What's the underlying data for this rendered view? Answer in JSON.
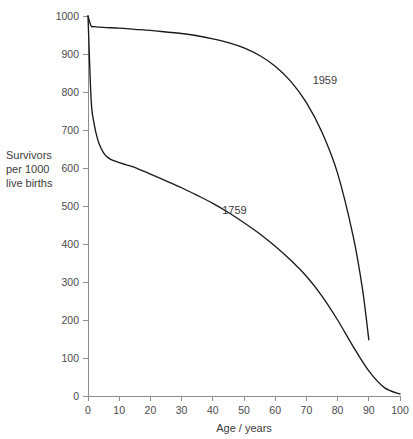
{
  "chart_data": {
    "type": "line",
    "title": "",
    "xlabel": "Age / years",
    "ylabel_lines": [
      "Survivors",
      "per 1000",
      "live births"
    ],
    "ylabel": "Survivors per 1000 live births",
    "xlim": [
      0,
      100
    ],
    "ylim": [
      0,
      1000
    ],
    "xticks": [
      0,
      10,
      20,
      30,
      40,
      50,
      60,
      70,
      80,
      90,
      100
    ],
    "xtick_labels": [
      "0",
      "10",
      "20",
      "30",
      "40",
      "50",
      "60",
      "70",
      "80",
      "90",
      "100"
    ],
    "yticks": [
      0,
      100,
      200,
      300,
      400,
      500,
      600,
      700,
      800,
      900,
      1000
    ],
    "ytick_labels": [
      "0",
      "100",
      "200",
      "300",
      "400",
      "500",
      "600",
      "700",
      "800",
      "900",
      "1000"
    ],
    "grid": false,
    "legend": "inline-annotations",
    "series": [
      {
        "name": "1759",
        "label": "1759",
        "color": "#1a1a1a",
        "x": [
          0,
          1,
          2,
          3,
          4,
          5,
          6,
          7,
          8,
          10,
          12,
          14,
          16,
          18,
          20,
          25,
          30,
          35,
          40,
          45,
          50,
          55,
          60,
          65,
          70,
          75,
          80,
          85,
          90,
          95,
          100
        ],
        "values": [
          1000,
          780,
          715,
          678,
          655,
          640,
          630,
          624,
          620,
          614,
          609,
          604,
          598,
          591,
          584,
          566,
          548,
          528,
          507,
          483,
          456,
          427,
          394,
          357,
          315,
          263,
          200,
          130,
          66,
          22,
          5
        ]
      },
      {
        "name": "1959",
        "label": "1959",
        "color": "#1a1a1a",
        "x": [
          0,
          1,
          2,
          5,
          10,
          15,
          20,
          25,
          30,
          35,
          40,
          45,
          50,
          55,
          60,
          65,
          70,
          75,
          80,
          85,
          88,
          90
        ],
        "values": [
          1000,
          974,
          972,
          970,
          968,
          965,
          962,
          958,
          954,
          948,
          940,
          930,
          916,
          896,
          868,
          828,
          772,
          694,
          586,
          420,
          280,
          148
        ]
      }
    ],
    "annotations": [
      {
        "text": "1759",
        "x": 43,
        "y": 478
      },
      {
        "text": "1959",
        "x": 72,
        "y": 820
      }
    ]
  },
  "axes": {
    "x_axis_label": "Age / years",
    "y_axis_label_line1": "Survivors",
    "y_axis_label_line2": "per 1000",
    "y_axis_label_line3": "live births"
  },
  "labels": {
    "series_1759": "1759",
    "series_1959": "1959"
  }
}
